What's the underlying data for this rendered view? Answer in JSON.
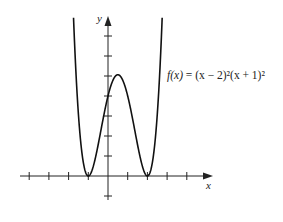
{
  "chart_data": {
    "type": "line",
    "title": "",
    "function_label": "f(x) = (x − 2)²(x + 1)²",
    "xlabel": "x",
    "ylabel": "y",
    "x_ticks": [
      -4,
      -3,
      -2,
      -1,
      0,
      1,
      2,
      3,
      4
    ],
    "y_ticks": [
      -1,
      1,
      2,
      3,
      4,
      5,
      6,
      7
    ],
    "xlim": [
      -4.5,
      5.3
    ],
    "ylim": [
      -1.5,
      8
    ],
    "tick_labels_shown": false,
    "grid": false,
    "series": [
      {
        "name": "f(x) = (x − 2)²(x + 1)²",
        "x": [
          -1.8,
          -1.5,
          -1,
          -0.5,
          0,
          0.5,
          1,
          1.5,
          2,
          2.5,
          2.8
        ],
        "y": [
          21.16,
          3.06,
          0,
          1.56,
          4,
          5.06,
          4,
          1.56,
          0,
          3.06,
          21.16
        ]
      }
    ],
    "key_points": {
      "local_minima": [
        [
          -1,
          0
        ],
        [
          2,
          0
        ]
      ],
      "local_maximum": [
        0.5,
        5.0625
      ],
      "y_intercept": [
        0,
        4
      ]
    }
  },
  "labels": {
    "x_axis": "x",
    "y_axis": "y",
    "equation_lhs": "f(x)",
    "equation_rhs": " = (x − 2)²(x + 1)²"
  }
}
